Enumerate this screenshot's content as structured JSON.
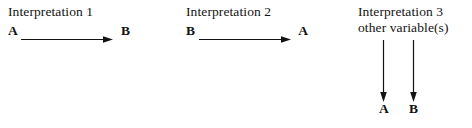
{
  "figure": {
    "background_color": "#ffffff",
    "ink_color": "#121212"
  },
  "panels": [
    {
      "id": "interpretation-1",
      "title": "Interpretation 1",
      "subtitle": "",
      "layout": "horizontal",
      "relation": {
        "source": "A",
        "target": "B",
        "arrow": "right-arrow"
      }
    },
    {
      "id": "interpretation-2",
      "title": "Interpretation 2",
      "subtitle": "",
      "layout": "horizontal",
      "relation": {
        "source": "B",
        "target": "A",
        "arrow": "right-arrow"
      }
    },
    {
      "id": "interpretation-3",
      "title": "Interpretation 3",
      "subtitle": "other variable(s)",
      "layout": "fork",
      "relation": {
        "source": "other variable(s)",
        "targets": [
          "A",
          "B"
        ],
        "arrow": "down-arrow"
      }
    }
  ]
}
